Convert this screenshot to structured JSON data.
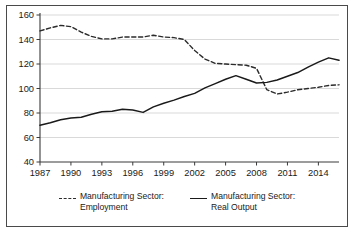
{
  "figure": {
    "clipped_caption": "",
    "background_color": "#ffffff",
    "border_color": "#4a4a4a"
  },
  "legend": {
    "position": "bottom-center",
    "entries": [
      {
        "marker": "dashed-line-swatch",
        "label": "Manufacturing Sector:\n  Employment",
        "color": "#2b2b2b",
        "style": "dashed"
      },
      {
        "marker": "solid-line-swatch",
        "label": "Manufacturing Sector:\n  Real Output",
        "color": "#1a1a1a",
        "style": "solid"
      }
    ]
  },
  "chart_data": {
    "type": "line",
    "title": "",
    "subtitle": "",
    "xlabel": "",
    "ylabel": "",
    "xlim": [
      1987,
      2016
    ],
    "ylim": [
      40,
      160
    ],
    "grid": true,
    "grid_axis": "y",
    "legend_position": "bottom-center",
    "yticks": [
      40,
      60,
      80,
      100,
      120,
      140,
      160
    ],
    "ytick_labels": [
      "40",
      "60",
      "80",
      "100",
      "120",
      "140",
      "160"
    ],
    "xticks": [
      1987,
      1990,
      1993,
      1996,
      1999,
      2002,
      2005,
      2008,
      2011,
      2014
    ],
    "xtick_labels": [
      "1987",
      "1990",
      "1993",
      "1996",
      "1999",
      "2002",
      "2005",
      "2008",
      "2011",
      "2014"
    ],
    "x": [
      1987,
      1988,
      1989,
      1990,
      1991,
      1992,
      1993,
      1994,
      1995,
      1996,
      1997,
      1998,
      1999,
      2000,
      2001,
      2002,
      2003,
      2004,
      2005,
      2006,
      2007,
      2008,
      2009,
      2010,
      2011,
      2012,
      2013,
      2014,
      2015,
      2016
    ],
    "series": [
      {
        "name": "Manufacturing Sector: Employment",
        "style": "dashed",
        "color": "#2b2b2b",
        "values": [
          147,
          149.5,
          151.5,
          150.5,
          146,
          142.5,
          140.5,
          140.5,
          142,
          142,
          142,
          143.5,
          142,
          141.5,
          140,
          131,
          124,
          120.5,
          120,
          119.5,
          119,
          116.5,
          99,
          95.5,
          97,
          99,
          100,
          101,
          102.5,
          103
        ]
      },
      {
        "name": "Manufacturing Sector: Real Output",
        "style": "solid",
        "color": "#1a1a1a",
        "values": [
          70,
          72,
          74.5,
          76,
          76.5,
          79,
          81,
          81.5,
          83,
          82.5,
          80.5,
          85,
          88,
          90.5,
          93.5,
          96,
          100.5,
          104,
          107.5,
          110.5,
          107.5,
          104.5,
          105,
          107,
          110,
          113,
          117.5,
          121.5,
          125,
          123
        ]
      }
    ],
    "annotations": [
      {
        "text": "recession trough",
        "x": 2009,
        "series": "both",
        "visible": false
      }
    ]
  }
}
